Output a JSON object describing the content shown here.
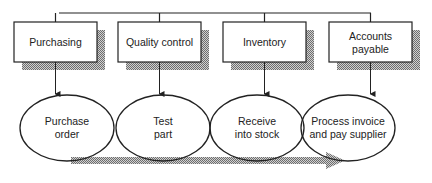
{
  "departments": [
    {
      "label_lines": [
        "Purchasing"
      ]
    },
    {
      "label_lines": [
        "Quality control"
      ]
    },
    {
      "label_lines": [
        "Inventory"
      ]
    },
    {
      "label_lines": [
        "Accounts",
        "payable"
      ]
    }
  ],
  "process_steps": [
    {
      "label_lines": [
        "Purchase",
        "order"
      ]
    },
    {
      "label_lines": [
        "Test",
        "part"
      ]
    },
    {
      "label_lines": [
        "Receive",
        "into stock"
      ]
    },
    {
      "label_lines": [
        "Process invoice",
        "and pay supplier"
      ]
    }
  ],
  "colors": {
    "line": "#222222",
    "shadow": "#9a9a9a",
    "flow_arrow": "#a8a8a8"
  }
}
